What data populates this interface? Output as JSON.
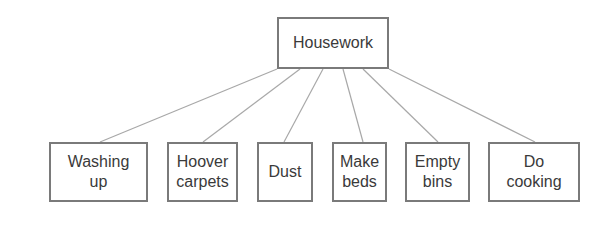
{
  "diagram": {
    "type": "tree",
    "colors": {
      "line": "#a8a8a8",
      "border": "#7a7a7a",
      "text": "#3a3a3a"
    },
    "root": {
      "label": "Housework",
      "box": [
        277,
        17,
        112,
        52
      ]
    },
    "children": [
      {
        "label": "Washing\nup",
        "box": [
          49,
          142,
          99,
          60
        ],
        "link": [
          277,
          69,
          100,
          142
        ]
      },
      {
        "label": "Hoover\ncarpets",
        "box": [
          167,
          142,
          71,
          60
        ],
        "link": [
          300,
          69,
          203,
          142
        ]
      },
      {
        "label": "Dust",
        "box": [
          257,
          142,
          56,
          60
        ],
        "link": [
          323,
          69,
          284,
          142
        ]
      },
      {
        "label": "Make\nbeds",
        "box": [
          332,
          142,
          55,
          60
        ],
        "link": [
          343,
          69,
          363,
          142
        ]
      },
      {
        "label": "Empty\nbins",
        "box": [
          405,
          142,
          65,
          60
        ],
        "link": [
          363,
          69,
          438,
          142
        ]
      },
      {
        "label": "Do\ncooking",
        "box": [
          488,
          142,
          92,
          60
        ],
        "link": [
          389,
          69,
          535,
          142
        ]
      }
    ]
  }
}
